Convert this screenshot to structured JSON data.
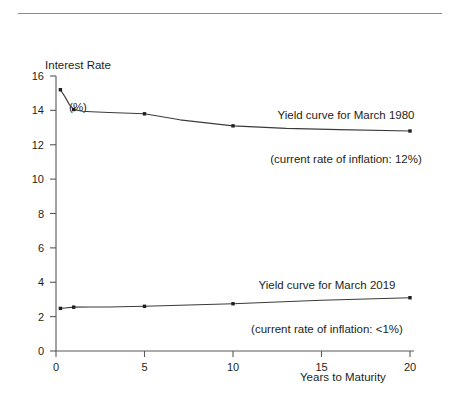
{
  "chart_data": {
    "type": "line",
    "title": "",
    "xlabel": "Years to Maturity",
    "ylabel": "Interest Rate\n(%)",
    "ylabel_line1": "Interest Rate",
    "ylabel_line2": "(%)",
    "xlim": [
      0,
      20
    ],
    "ylim": [
      0,
      16
    ],
    "xticks": [
      0,
      5,
      10,
      15,
      20
    ],
    "xtick_labels": [
      "0",
      "5",
      "10",
      "15",
      "20"
    ],
    "yticks": [
      0,
      2,
      4,
      6,
      8,
      10,
      12,
      14,
      16
    ],
    "ytick_labels": [
      "0",
      "2",
      "4",
      "6",
      "8",
      "10",
      "12",
      "14",
      "16"
    ],
    "grid": false,
    "legend": "none",
    "series": [
      {
        "name": "Yield curve for March 1980",
        "color": "#3b3b3b",
        "x": [
          0.25,
          0.5,
          0.75,
          1.0,
          1.5,
          2.0,
          3.0,
          5.0,
          7.0,
          10.0,
          13.0,
          16.0,
          20.0
        ],
        "values": [
          15.2,
          14.8,
          14.35,
          14.05,
          13.95,
          13.92,
          13.88,
          13.8,
          13.45,
          13.1,
          12.95,
          12.88,
          12.8
        ],
        "markers_at": [
          0.25,
          1.0,
          5.0,
          10.0,
          20.0
        ]
      },
      {
        "name": "Yield curve for March 2019",
        "color": "#3b3b3b",
        "x": [
          0.25,
          0.5,
          1.0,
          2.0,
          3.0,
          5.0,
          7.0,
          10.0,
          15.0,
          20.0
        ],
        "values": [
          2.48,
          2.5,
          2.55,
          2.56,
          2.56,
          2.6,
          2.66,
          2.75,
          2.95,
          3.1
        ],
        "markers_at": [
          0.25,
          1.0,
          5.0,
          10.0,
          20.0
        ]
      }
    ],
    "annotations": [
      {
        "id": "annotation-1980",
        "line1": "Yield curve for March 1980",
        "line2": "(current rate of inflation: 12%)"
      },
      {
        "id": "annotation-2019",
        "line1": "Yield curve for March 2019",
        "line2": "(current rate of inflation: <1%)"
      }
    ]
  },
  "colors": {
    "axis": "#58595b",
    "line": "#3b3b3b",
    "text": "#231f20",
    "rule": "#8e8e8e",
    "background": "#ffffff"
  }
}
